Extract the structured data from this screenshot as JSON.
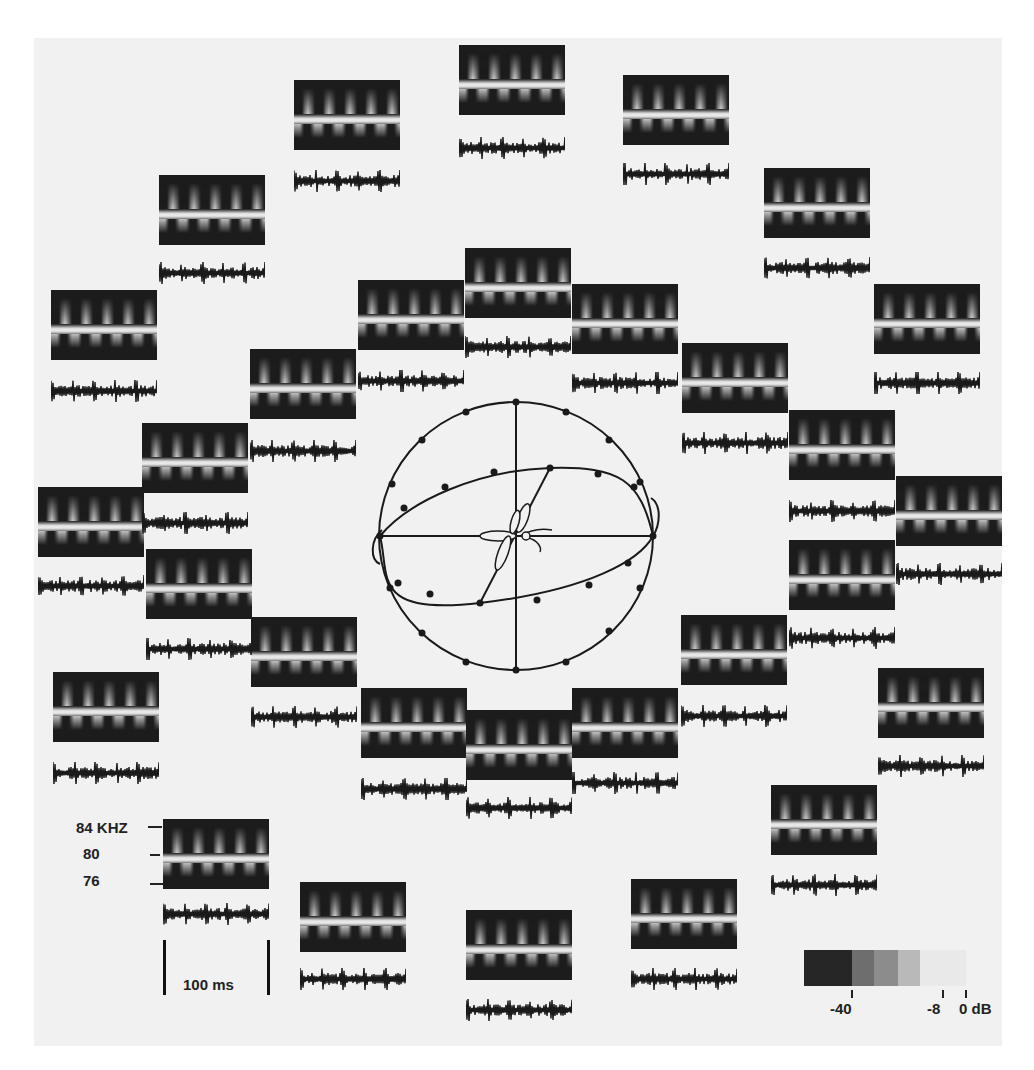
{
  "figure": {
    "frequency_axis": {
      "labels": [
        "84 KHZ",
        "80",
        "76"
      ]
    },
    "time_scale": {
      "label": "100 ms"
    },
    "colorbar": {
      "tick_labels": [
        "-40",
        "-8",
        "0 dB"
      ],
      "shades": [
        "#262626",
        "#6e6e6e",
        "#8c8c8c",
        "#b9b9b9",
        "#e9e9e9"
      ]
    },
    "center_diagram": {
      "type": "sphere-with-meridians",
      "subject": "insect-moth"
    }
  },
  "panels": [
    {
      "x": 459,
      "y": 45
    },
    {
      "x": 294,
      "y": 80
    },
    {
      "x": 623,
      "y": 75
    },
    {
      "x": 159,
      "y": 175
    },
    {
      "x": 764,
      "y": 168
    },
    {
      "x": 465,
      "y": 248
    },
    {
      "x": 358,
      "y": 280
    },
    {
      "x": 572,
      "y": 284
    },
    {
      "x": 51,
      "y": 290
    },
    {
      "x": 874,
      "y": 284
    },
    {
      "x": 250,
      "y": 349
    },
    {
      "x": 682,
      "y": 343
    },
    {
      "x": 142,
      "y": 423
    },
    {
      "x": 789,
      "y": 410
    },
    {
      "x": 38,
      "y": 487
    },
    {
      "x": 896,
      "y": 476
    },
    {
      "x": 146,
      "y": 549
    },
    {
      "x": 789,
      "y": 540
    },
    {
      "x": 251,
      "y": 617
    },
    {
      "x": 681,
      "y": 615
    },
    {
      "x": 53,
      "y": 672
    },
    {
      "x": 878,
      "y": 668
    },
    {
      "x": 361,
      "y": 688
    },
    {
      "x": 572,
      "y": 688
    },
    {
      "x": 466,
      "y": 710
    },
    {
      "x": 771,
      "y": 785
    },
    {
      "x": 163,
      "y": 819
    },
    {
      "x": 300,
      "y": 882
    },
    {
      "x": 631,
      "y": 879
    },
    {
      "x": 466,
      "y": 910
    }
  ],
  "oscillograms": [
    {
      "x": 459,
      "y": 137
    },
    {
      "x": 294,
      "y": 170
    },
    {
      "x": 623,
      "y": 163
    },
    {
      "x": 159,
      "y": 262
    },
    {
      "x": 764,
      "y": 257
    },
    {
      "x": 465,
      "y": 336
    },
    {
      "x": 358,
      "y": 370
    },
    {
      "x": 572,
      "y": 372
    },
    {
      "x": 51,
      "y": 380
    },
    {
      "x": 874,
      "y": 372
    },
    {
      "x": 250,
      "y": 440
    },
    {
      "x": 682,
      "y": 432
    },
    {
      "x": 142,
      "y": 512
    },
    {
      "x": 789,
      "y": 500
    },
    {
      "x": 38,
      "y": 575
    },
    {
      "x": 896,
      "y": 563
    },
    {
      "x": 146,
      "y": 638
    },
    {
      "x": 789,
      "y": 627
    },
    {
      "x": 251,
      "y": 706
    },
    {
      "x": 681,
      "y": 705
    },
    {
      "x": 53,
      "y": 762
    },
    {
      "x": 878,
      "y": 755
    },
    {
      "x": 361,
      "y": 778
    },
    {
      "x": 572,
      "y": 772
    },
    {
      "x": 466,
      "y": 797
    },
    {
      "x": 771,
      "y": 874
    },
    {
      "x": 163,
      "y": 903
    },
    {
      "x": 300,
      "y": 968
    },
    {
      "x": 631,
      "y": 968
    },
    {
      "x": 466,
      "y": 999
    }
  ]
}
